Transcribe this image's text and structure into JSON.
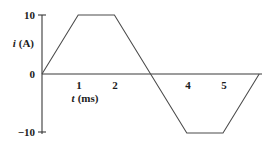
{
  "chart_data": {
    "type": "line",
    "title": "",
    "xlabel": "t (ms)",
    "ylabel": "i (A)",
    "xlabel_var": "t",
    "xlabel_unit": "(ms)",
    "ylabel_var": "i",
    "ylabel_unit": "(A)",
    "x": [
      0,
      1,
      2,
      4,
      5,
      6
    ],
    "values": [
      0,
      10,
      10,
      -10,
      -10,
      0
    ],
    "series": [
      {
        "name": "current",
        "points": [
          {
            "t": 0,
            "i": 0
          },
          {
            "t": 1,
            "i": 10
          },
          {
            "t": 2,
            "i": 10
          },
          {
            "t": 4,
            "i": -10
          },
          {
            "t": 5,
            "i": -10
          },
          {
            "t": 6,
            "i": 0
          }
        ]
      }
    ],
    "xlim": [
      0,
      6
    ],
    "ylim": [
      -10,
      10
    ],
    "xticks": [
      1,
      2,
      4,
      5
    ],
    "xtick_labels": [
      "1",
      "2",
      "4",
      "5"
    ],
    "yticks": [
      10,
      0,
      -10
    ],
    "ytick_labels": [
      "10",
      "0",
      "−10"
    ],
    "grid": false,
    "legend": false,
    "zero_crossing": 3,
    "colors": {
      "line": "#4a4a4a",
      "axis": "#3a3a3a",
      "text": "#1c1c1c",
      "background": "#ffffff"
    }
  },
  "labels": {
    "y_tick_top": "10",
    "y_tick_zero": "0",
    "y_tick_bottom": "−10",
    "x_tick_1": "1",
    "x_tick_2": "2",
    "x_tick_4": "4",
    "x_tick_5": "5",
    "y_axis_var": "i",
    "y_axis_unit": "(A)",
    "x_axis_var": "t",
    "x_axis_unit": "(ms)"
  }
}
